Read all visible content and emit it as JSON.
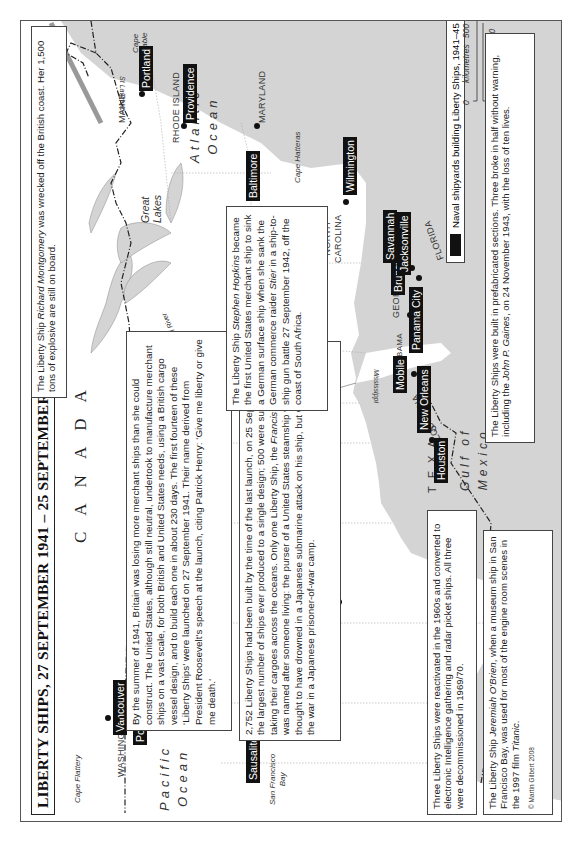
{
  "title": "LIBERTY SHIPS, 27 SEPTEMBER 1941 – 25 SEPTEMBER 1945",
  "countries": {
    "canada": "CANADA",
    "united_states": "UNITED STATES",
    "mexico": "MEXICO"
  },
  "states": {
    "washington": "WASHINGTON",
    "oregon": "OREGON",
    "california": "CALIFORNIA",
    "texas": "TEXAS",
    "louisiana": "LOUISIANA",
    "alabama": "ALABAMA",
    "georgia": "GEORGIA",
    "florida": "FLORIDA",
    "north_carolina_1": "NORTH",
    "north_carolina_2": "CAROLINA",
    "maryland": "MARYLAND",
    "rhode_island": "RHODE ISLAND",
    "maine": "MAINE"
  },
  "oceans": {
    "pacific_1": "Pacific",
    "pacific_2": "Ocean",
    "atlantic_1": "Atlantic",
    "atlantic_2": "Ocean",
    "gulf_1": "Gulf of",
    "gulf_2": "Mexico"
  },
  "features": {
    "cape_flattery": "Cape Flattery",
    "san_francisco_bay_1": "San Francisco",
    "san_francisco_bay_2": "Bay",
    "great_lakes_1": "Great",
    "great_lakes_2": "Lakes",
    "mississippi_river": "Mississippi River",
    "mississippi": "Mississippi",
    "st_lawrence": "St Lawrence",
    "cape_hatteras": "Cape Hatteras",
    "cape_sable_1": "Cape",
    "cape_sable_2": "Sable"
  },
  "shipyards": [
    {
      "name": "Vancouver"
    },
    {
      "name": "Portland"
    },
    {
      "name": "Richmond"
    },
    {
      "name": "Sausalito"
    },
    {
      "name": "Los Angeles"
    },
    {
      "name": "Houston"
    },
    {
      "name": "New Orleans"
    },
    {
      "name": "Mobile"
    },
    {
      "name": "Panama City"
    },
    {
      "name": "Brunswick"
    },
    {
      "name": "Savannah"
    },
    {
      "name": "Jacksonville"
    },
    {
      "name": "Wilmington"
    },
    {
      "name": "Baltimore"
    },
    {
      "name": "Providence"
    },
    {
      "name": "Portland"
    }
  ],
  "legend": {
    "label": "Naval shipyards building Liberty Ships, 1941–45",
    "color": "#111111"
  },
  "scale": {
    "km_label": "kilometres",
    "km_0": "0",
    "km_max": "500",
    "mi_label": "miles",
    "mi_0": "0",
    "mi_max": "300"
  },
  "notes": {
    "montgomery_1": "The Liberty Ship ",
    "montgomery_ship": "Richard Montgomery",
    "montgomery_2": " was wrecked off the British coast. Her 1,500 tons of explosive are still on board.",
    "origin": "By the summer of 1941, Britain was losing more merchant ships than she could construct. The United States, although still neutral, undertook to manufacture merchant ships on a vast scale, for both British and United States needs, using a British cargo vessel design, and to build each one in about 230 days. The first fourteen of these ‘Liberty Ships’ were launched on 27 September 1941. Their name derived from President Roosevelt’s speech at the launch, citing Patrick Henry: ‘Give me liberty or give me death.’",
    "stats_1": "2,752 Liberty Ships had been built by the time of the last launch, on 25 September 1945; the largest number of ships ever produced to a single design; 500 were sunk while taking their cargoes across the oceans. Only one Liberty Ship, the ",
    "stats_ship": "Francis J. O’Gara",
    "stats_2": ", was named after someone living: the purser of a United States steamship who was thought to have drowned in a Japanese submarine attack on his ship, but who survived the war in a Japanese prisoner-of-war camp.",
    "hopkins_1": "The Liberty Ship ",
    "hopkins_ship": "Stephen Hopkins",
    "hopkins_2": " became the first United States merchant ship to sink a German surface ship when she sank the German commerce raider ",
    "hopkins_raider": "Stier",
    "hopkins_3": " in a ship-to-ship gun battle 27 September 1942, off the coast of South Africa.",
    "reactivated": "Three Liberty Ships were reactivated in the 1960s and converted to electronic Intelligence gathering and radar picket ships. All three were decommissioned in 1969/70.",
    "obrien_1": "The Liberty Ship ",
    "obrien_ship": "Jeremiah O’Brien",
    "obrien_2": ", when a museum ship in San Francisco Bay, was used for most of the engine room scenes in the 1997 film ",
    "obrien_film": "Titanic",
    "obrien_3": ".",
    "prefab_1": "The Liberty Ships were built in prefabricated sections. Three broke in half without warning, including the ",
    "prefab_ship": "John P. Gaines",
    "prefab_2": ", on 24 November 1943, with the loss of ten lives."
  },
  "copyright": "© Martin Gilbert 2008"
}
